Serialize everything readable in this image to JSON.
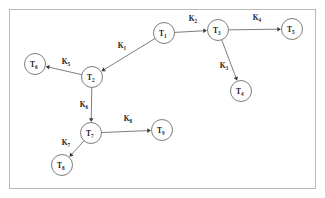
{
  "figure": {
    "type": "directed-graph",
    "frame": {
      "stroke_color": "#b9b9b9",
      "background": "#ffffff"
    },
    "node_style": {
      "fill": "#ffffff",
      "stroke": "#6f6f6f",
      "radius": 10.5
    },
    "edge_style": {
      "stroke": "#6f6f6f",
      "arrow_fill": "#3a3a3a"
    }
  },
  "nodes": [
    {
      "id": "T1",
      "base": "T",
      "sub": "1",
      "cx": 164,
      "cy": 33
    },
    {
      "id": "T2",
      "base": "T",
      "sub": "2",
      "cx": 92,
      "cy": 77
    },
    {
      "id": "T3",
      "base": "T",
      "sub": "3",
      "cx": 218,
      "cy": 30
    },
    {
      "id": "T4",
      "base": "T",
      "sub": "4",
      "cx": 241,
      "cy": 91
    },
    {
      "id": "T5",
      "base": "T",
      "sub": "5",
      "cx": 292,
      "cy": 29
    },
    {
      "id": "T6",
      "base": "T",
      "sub": "6",
      "cx": 35,
      "cy": 64
    },
    {
      "id": "T7",
      "base": "T",
      "sub": "7",
      "cx": 91,
      "cy": 133
    },
    {
      "id": "T8",
      "base": "T",
      "sub": "8",
      "cx": 62,
      "cy": 165
    },
    {
      "id": "T9",
      "base": "T",
      "sub": "9",
      "cx": 162,
      "cy": 130
    }
  ],
  "edges": [
    {
      "id": "K1",
      "base": "K",
      "sub": "1",
      "from": "T1",
      "to": "T2",
      "label_x": 122,
      "label_y": 48
    },
    {
      "id": "K2",
      "base": "K",
      "sub": "2",
      "from": "T1",
      "to": "T3",
      "label_x": 193,
      "label_y": 21
    },
    {
      "id": "K3",
      "base": "K",
      "sub": "3",
      "from": "T3",
      "to": "T4",
      "label_x": 224,
      "label_y": 68
    },
    {
      "id": "K4",
      "base": "K",
      "sub": "4",
      "from": "T3",
      "to": "T5",
      "label_x": 257,
      "label_y": 20
    },
    {
      "id": "K5",
      "base": "K",
      "sub": "5",
      "from": "T2",
      "to": "T6",
      "label_x": 66,
      "label_y": 64
    },
    {
      "id": "K6",
      "base": "K",
      "sub": "6",
      "from": "T2",
      "to": "T7",
      "label_x": 84,
      "label_y": 107
    },
    {
      "id": "K7",
      "base": "K",
      "sub": "7",
      "from": "T7",
      "to": "T8",
      "label_x": 66,
      "label_y": 145
    },
    {
      "id": "K8",
      "base": "K",
      "sub": "8",
      "from": "T7",
      "to": "T9",
      "label_x": 128,
      "label_y": 121
    }
  ]
}
